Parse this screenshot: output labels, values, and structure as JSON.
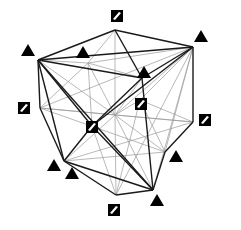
{
  "diagram": {
    "type": "polyhedron-projection",
    "colors": {
      "bold_edge": "#1a1a1a",
      "thin_edge": "#9a9a9a",
      "marker": "#000000",
      "background": "#ffffff"
    },
    "vertices": {
      "T": [
        115,
        30
      ],
      "TL": [
        38,
        60
      ],
      "TR": [
        193,
        47
      ],
      "IA": [
        88,
        63
      ],
      "IB": [
        142,
        78
      ],
      "IC": [
        140,
        100
      ],
      "C": [
        115,
        115
      ],
      "L": [
        40,
        108
      ],
      "R": [
        193,
        122
      ],
      "CS": [
        92,
        126
      ],
      "BL": [
        64,
        161
      ],
      "RM": [
        165,
        152
      ],
      "B": [
        116,
        195
      ],
      "BR": [
        153,
        190
      ]
    },
    "bold_edges": [
      [
        "T",
        "TL"
      ],
      [
        "T",
        "TR"
      ],
      [
        "TL",
        "TR"
      ],
      [
        "T",
        "IB"
      ],
      [
        "TL",
        "IB"
      ],
      [
        "TR",
        "IB"
      ],
      [
        "IB",
        "CS"
      ],
      [
        "TR",
        "R"
      ],
      [
        "R",
        "RM"
      ],
      [
        "RM",
        "BR"
      ],
      [
        "BR",
        "B"
      ],
      [
        "B",
        "BL"
      ],
      [
        "BL",
        "L"
      ],
      [
        "L",
        "TL"
      ],
      [
        "TL",
        "CS"
      ],
      [
        "CS",
        "BL"
      ],
      [
        "TL",
        "BR"
      ],
      [
        "TR",
        "CS"
      ],
      [
        "CS",
        "BR"
      ],
      [
        "IB",
        "BR"
      ],
      [
        "TL",
        "BL"
      ],
      [
        "BL",
        "BR"
      ]
    ],
    "thin_edges": [
      [
        "IA",
        "T"
      ],
      [
        "IA",
        "TL"
      ],
      [
        "IA",
        "TR"
      ],
      [
        "IA",
        "C"
      ],
      [
        "IA",
        "CS"
      ],
      [
        "IA",
        "IB"
      ],
      [
        "C",
        "T"
      ],
      [
        "C",
        "TL"
      ],
      [
        "C",
        "TR"
      ],
      [
        "C",
        "R"
      ],
      [
        "C",
        "RM"
      ],
      [
        "C",
        "B"
      ],
      [
        "C",
        "BL"
      ],
      [
        "C",
        "L"
      ],
      [
        "C",
        "IB"
      ],
      [
        "C",
        "BR"
      ],
      [
        "IC",
        "TR"
      ],
      [
        "IC",
        "R"
      ],
      [
        "IC",
        "C"
      ],
      [
        "IC",
        "RM"
      ],
      [
        "IC",
        "B"
      ],
      [
        "RM",
        "TR"
      ],
      [
        "RM",
        "BL"
      ],
      [
        "RM",
        "L"
      ],
      [
        "L",
        "TR"
      ],
      [
        "L",
        "R"
      ],
      [
        "B",
        "TR"
      ],
      [
        "B",
        "CS"
      ],
      [
        "L",
        "IA"
      ],
      [
        "BR",
        "TR"
      ],
      [
        "R",
        "BL"
      ]
    ],
    "markers": [
      {
        "kind": "square",
        "name": "marker-top",
        "x": 117,
        "y": 16
      },
      {
        "kind": "triangle",
        "name": "marker-top-left",
        "x": 28,
        "y": 51
      },
      {
        "kind": "triangle",
        "name": "marker-upper-inner",
        "x": 83,
        "y": 53
      },
      {
        "kind": "triangle",
        "name": "marker-top-right",
        "x": 201,
        "y": 37
      },
      {
        "kind": "triangle",
        "name": "marker-inner-right",
        "x": 144,
        "y": 73
      },
      {
        "kind": "square",
        "name": "marker-inner-square",
        "x": 141,
        "y": 104
      },
      {
        "kind": "square",
        "name": "marker-left",
        "x": 24,
        "y": 108
      },
      {
        "kind": "square",
        "name": "marker-center",
        "x": 92,
        "y": 127
      },
      {
        "kind": "square",
        "name": "marker-right",
        "x": 205,
        "y": 120
      },
      {
        "kind": "triangle",
        "name": "marker-lower-left-1",
        "x": 54,
        "y": 166
      },
      {
        "kind": "triangle",
        "name": "marker-lower-left-2",
        "x": 72,
        "y": 174
      },
      {
        "kind": "triangle",
        "name": "marker-lower-right",
        "x": 176,
        "y": 157
      },
      {
        "kind": "triangle",
        "name": "marker-bottom-right",
        "x": 157,
        "y": 201
      },
      {
        "kind": "square",
        "name": "marker-bottom",
        "x": 114,
        "y": 210
      }
    ]
  }
}
